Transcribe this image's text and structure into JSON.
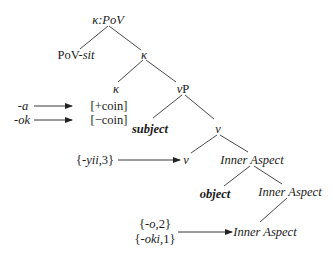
{
  "tree": {
    "root": {
      "prefix": "κ:",
      "head": "PoV"
    },
    "pov_sit": {
      "prefix": "PoV-",
      "suffix": "sit"
    },
    "kappa_bar": "κ",
    "kappa_head": "κ",
    "vP": {
      "prefix": "ν",
      "suffix": "P"
    },
    "subject": "subject",
    "v_bar": "ν",
    "v_head": "ν",
    "inner_aspect_1": "Inner Aspect",
    "object": "object",
    "inner_aspect_2": "Inner Aspect",
    "inner_aspect_3": "Inner Aspect"
  },
  "features": {
    "coin_plus": "[+coin]",
    "coin_minus": "[−coin]"
  },
  "morphemes": {
    "a": "-a",
    "ok": "-ok",
    "yii": {
      "open": "{-",
      "morph": "yii",
      "close": ",3}"
    },
    "o": {
      "open": "{-",
      "morph": "o",
      "close": ",2}"
    },
    "oki": {
      "open": "{-",
      "morph": "oki",
      "close": ",1}"
    }
  }
}
